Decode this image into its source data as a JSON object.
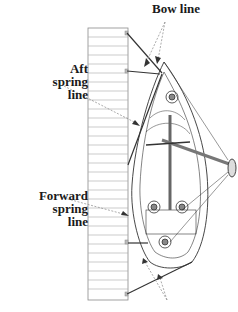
{
  "diagram": {
    "labels": {
      "bow_line": "Bow line",
      "aft_spring_line": [
        "Aft",
        "spring",
        "line"
      ],
      "forward_spring_line": [
        "Forward",
        "spring",
        "line"
      ]
    },
    "elements": [
      "dock",
      "sailboat",
      "bow lines",
      "aft spring line",
      "forward spring line",
      "stern line",
      "outboard motor"
    ],
    "colors": {
      "line": "#333333",
      "dashed_pointer": "#888888",
      "dock_planks": "#9a9a9a"
    }
  }
}
